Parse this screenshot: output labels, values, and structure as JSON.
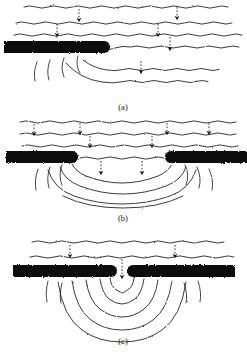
{
  "figure": {
    "type": "physics-diagram",
    "background_color": "#ffffff",
    "ink_color": "#111111",
    "wave_line_color": "#1a1a1a",
    "barrier_color": "#111111",
    "arrow_color": "#1a1a1a",
    "panels": [
      {
        "id": "panel-a",
        "caption": "(a)",
        "caption_x": 123,
        "caption_y": 110,
        "description": "plane waves bending around the edge of a single straight barrier",
        "incident_wavefronts": 3,
        "incident_arrows": 5,
        "barriers": [
          {
            "name": "left-barrier",
            "x": 4,
            "y": 41,
            "width": 104,
            "height": 12,
            "edge": "right-rounded"
          }
        ],
        "aperture": "none-single-edge",
        "diffracted_wavefronts": 3,
        "edge_fringes": 4
      },
      {
        "id": "panel-b",
        "caption": "(b)",
        "caption_x": 123,
        "caption_y": 221,
        "description": "plane waves passing through a wide gap between two barriers, bending slightly at the edges",
        "incident_wavefronts": 3,
        "incident_arrows": 6,
        "barriers": [
          {
            "name": "left-barrier",
            "x": 6,
            "y": 151,
            "width": 70,
            "height": 12,
            "edge": "right-rounded"
          },
          {
            "name": "right-barrier",
            "x": 167,
            "y": 151,
            "width": 78,
            "height": 12,
            "edge": "left-rounded"
          }
        ],
        "aperture": {
          "name": "wide-gap",
          "x_start": 76,
          "x_end": 167,
          "width": 91
        },
        "diffracted_wavefronts": 4,
        "edge_fringes": 6
      },
      {
        "id": "panel-c",
        "caption": "(c)",
        "caption_x": 123,
        "caption_y": 344,
        "description": "plane waves passing through a narrow slit producing nearly semicircular wavefronts",
        "incident_wavefronts": 2,
        "incident_arrows": 2,
        "barriers": [
          {
            "name": "left-barrier",
            "x": 13,
            "y": 265,
            "width": 101,
            "height": 12,
            "edge": "right-rounded"
          },
          {
            "name": "right-barrier",
            "x": 130,
            "y": 265,
            "width": 105,
            "height": 12,
            "edge": "left-rounded"
          }
        ],
        "aperture": {
          "name": "narrow-slit",
          "x_start": 114,
          "x_end": 130,
          "width": 16
        },
        "diffracted_wavefronts": 5,
        "edge_fringes": 4
      }
    ],
    "captions": {
      "a": "(a)",
      "b": "(b)",
      "c": "(c)"
    }
  }
}
